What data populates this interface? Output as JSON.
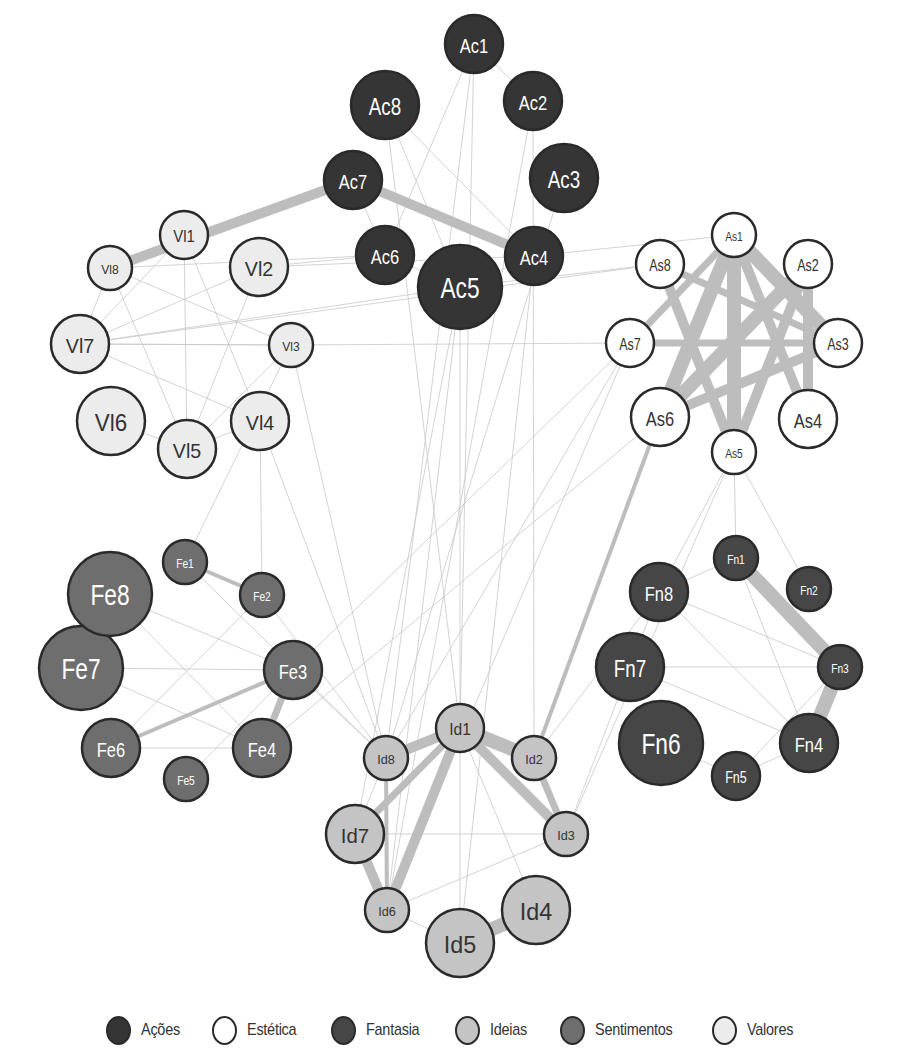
{
  "groups": [
    {
      "id": "Ac",
      "name": "Ações",
      "fill": "#353535",
      "text": "#ffffff"
    },
    {
      "id": "As",
      "name": "Estética",
      "fill": "#ffffff",
      "text": "#333333"
    },
    {
      "id": "Fn",
      "name": "Fantasia",
      "fill": "#464646",
      "text": "#ffffff"
    },
    {
      "id": "Id",
      "name": "Ideias",
      "fill": "#c4c4c4",
      "text": "#333333"
    },
    {
      "id": "Fe",
      "name": "Sentimentos",
      "fill": "#6e6e6e",
      "text": "#ffffff"
    },
    {
      "id": "Vl",
      "name": "Valores",
      "fill": "#ececec",
      "text": "#333333"
    }
  ],
  "colors": {
    "stroke": "#2a2a2a",
    "edge": "#c8c8c8",
    "thick_edge": "#bdbdbd"
  },
  "nodes": [
    {
      "id": "Ac1",
      "label": "Ac1",
      "group": "Ac",
      "size": 2
    },
    {
      "id": "Ac2",
      "label": "Ac2",
      "group": "Ac",
      "size": 2
    },
    {
      "id": "Ac3",
      "label": "Ac3",
      "group": "Ac",
      "size": 3
    },
    {
      "id": "Ac4",
      "label": "Ac4",
      "group": "Ac",
      "size": 2
    },
    {
      "id": "Ac5",
      "label": "Ac5",
      "group": "Ac",
      "size": 4
    },
    {
      "id": "Ac6",
      "label": "Ac6",
      "group": "Ac",
      "size": 2
    },
    {
      "id": "Ac7",
      "label": "Ac7",
      "group": "Ac",
      "size": 2
    },
    {
      "id": "Ac8",
      "label": "Ac8",
      "group": "Ac",
      "size": 3
    },
    {
      "id": "Vl1",
      "label": "Vl1",
      "group": "Vl",
      "size": 1
    },
    {
      "id": "Vl2",
      "label": "Vl2",
      "group": "Vl",
      "size": 2
    },
    {
      "id": "Vl3",
      "label": "Vl3",
      "group": "Vl",
      "size": 0
    },
    {
      "id": "Vl4",
      "label": "Vl4",
      "group": "Vl",
      "size": 2
    },
    {
      "id": "Vl5",
      "label": "Vl5",
      "group": "Vl",
      "size": 2
    },
    {
      "id": "Vl6",
      "label": "Vl6",
      "group": "Vl",
      "size": 3
    },
    {
      "id": "Vl7",
      "label": "Vl7",
      "group": "Vl",
      "size": 2
    },
    {
      "id": "Vl8",
      "label": "Vl8",
      "group": "Vl",
      "size": 0
    },
    {
      "id": "As1",
      "label": "As1",
      "group": "As",
      "size": 0
    },
    {
      "id": "As2",
      "label": "As2",
      "group": "As",
      "size": 1
    },
    {
      "id": "As3",
      "label": "As3",
      "group": "As",
      "size": 1
    },
    {
      "id": "As4",
      "label": "As4",
      "group": "As",
      "size": 2
    },
    {
      "id": "As5",
      "label": "As5",
      "group": "As",
      "size": 0
    },
    {
      "id": "As6",
      "label": "As6",
      "group": "As",
      "size": 2
    },
    {
      "id": "As7",
      "label": "As7",
      "group": "As",
      "size": 1
    },
    {
      "id": "As8",
      "label": "As8",
      "group": "As",
      "size": 1
    },
    {
      "id": "Fe1",
      "label": "Fe1",
      "group": "Fe",
      "size": 0
    },
    {
      "id": "Fe2",
      "label": "Fe2",
      "group": "Fe",
      "size": 0
    },
    {
      "id": "Fe3",
      "label": "Fe3",
      "group": "Fe",
      "size": 2
    },
    {
      "id": "Fe4",
      "label": "Fe4",
      "group": "Fe",
      "size": 2
    },
    {
      "id": "Fe5",
      "label": "Fe5",
      "group": "Fe",
      "size": 0
    },
    {
      "id": "Fe6",
      "label": "Fe6",
      "group": "Fe",
      "size": 2
    },
    {
      "id": "Fe7",
      "label": "Fe7",
      "group": "Fe",
      "size": 4
    },
    {
      "id": "Fe8",
      "label": "Fe8",
      "group": "Fe",
      "size": 4
    },
    {
      "id": "Fn1",
      "label": "Fn1",
      "group": "Fn",
      "size": 0
    },
    {
      "id": "Fn2",
      "label": "Fn2",
      "group": "Fn",
      "size": 0
    },
    {
      "id": "Fn3",
      "label": "Fn3",
      "group": "Fn",
      "size": 0
    },
    {
      "id": "Fn4",
      "label": "Fn4",
      "group": "Fn",
      "size": 2
    },
    {
      "id": "Fn5",
      "label": "Fn5",
      "group": "Fn",
      "size": 1
    },
    {
      "id": "Fn6",
      "label": "Fn6",
      "group": "Fn",
      "size": 4
    },
    {
      "id": "Fn7",
      "label": "Fn7",
      "group": "Fn",
      "size": 3
    },
    {
      "id": "Fn8",
      "label": "Fn8",
      "group": "Fn",
      "size": 2
    },
    {
      "id": "Id1",
      "label": "Id1",
      "group": "Id",
      "size": 1
    },
    {
      "id": "Id2",
      "label": "Id2",
      "group": "Id",
      "size": 0
    },
    {
      "id": "Id3",
      "label": "Id3",
      "group": "Id",
      "size": 0
    },
    {
      "id": "Id4",
      "label": "Id4",
      "group": "Id",
      "size": 3
    },
    {
      "id": "Id5",
      "label": "Id5",
      "group": "Id",
      "size": 3
    },
    {
      "id": "Id6",
      "label": "Id6",
      "group": "Id",
      "size": 0
    },
    {
      "id": "Id7",
      "label": "Id7",
      "group": "Id",
      "size": 2
    },
    {
      "id": "Id8",
      "label": "Id8",
      "group": "Id",
      "size": 0
    }
  ],
  "edges": [
    [
      "Ac7",
      "Vl8",
      3
    ],
    [
      "Ac7",
      "Ac4",
      3
    ],
    [
      "Ac1",
      "Ac2",
      0
    ],
    [
      "Ac8",
      "Ac4",
      0
    ],
    [
      "Ac7",
      "Ac6",
      0
    ],
    [
      "Ac6",
      "Ac5",
      0
    ],
    [
      "Ac5",
      "Ac4",
      0
    ],
    [
      "Ac1",
      "Ac6",
      0
    ],
    [
      "Ac8",
      "Ac5",
      0
    ],
    [
      "Ac6",
      "Vl2",
      0
    ],
    [
      "Ac6",
      "Vl8",
      0
    ],
    [
      "Ac4",
      "As1",
      0
    ],
    [
      "Ac5",
      "As8",
      0
    ],
    [
      "Ac4",
      "Vl2",
      0
    ],
    [
      "Ac5",
      "Vl7",
      0
    ],
    [
      "Ac1",
      "Id8",
      0
    ],
    [
      "Ac1",
      "Id1",
      0
    ],
    [
      "Ac2",
      "Id2",
      0
    ],
    [
      "Ac5",
      "Id7",
      0
    ],
    [
      "Ac5",
      "Id1",
      0
    ],
    [
      "Ac5",
      "Id6",
      0
    ],
    [
      "Ac2",
      "Id6",
      0
    ],
    [
      "Ac8",
      "Id1",
      0
    ],
    [
      "Ac4",
      "Id5",
      0
    ],
    [
      "Ac3",
      "Id8",
      0
    ],
    [
      "Vl1",
      "Vl5",
      0
    ],
    [
      "Vl1",
      "Vl4",
      0
    ],
    [
      "Vl8",
      "Vl3",
      0
    ],
    [
      "Vl8",
      "Vl5",
      0
    ],
    [
      "Vl2",
      "Vl7",
      0
    ],
    [
      "Vl1",
      "Vl7",
      0
    ],
    [
      "Vl7",
      "Vl3",
      0
    ],
    [
      "Vl7",
      "Vl4",
      0
    ],
    [
      "Vl2",
      "Vl5",
      0
    ],
    [
      "Vl6",
      "Vl5",
      0
    ],
    [
      "Vl5",
      "Vl4",
      0
    ],
    [
      "Vl3",
      "Vl5",
      0
    ],
    [
      "Vl3",
      "Vl7",
      0
    ],
    [
      "Vl8",
      "Vl7",
      0
    ],
    [
      "Vl3",
      "Id8",
      0
    ],
    [
      "Vl4",
      "Id8",
      0
    ],
    [
      "Vl3",
      "Fe1",
      0
    ],
    [
      "Vl4",
      "Fe2",
      0
    ],
    [
      "Vl3",
      "As7",
      0
    ],
    [
      "Vl7",
      "As8",
      0
    ],
    [
      "As1",
      "As3",
      4
    ],
    [
      "As1",
      "As5",
      4
    ],
    [
      "As1",
      "As6",
      4
    ],
    [
      "As2",
      "As6",
      4
    ],
    [
      "As1",
      "As4",
      3
    ],
    [
      "As8",
      "As5",
      3
    ],
    [
      "As2",
      "As4",
      3
    ],
    [
      "As7",
      "As3",
      2
    ],
    [
      "As1",
      "As7",
      2
    ],
    [
      "As2",
      "As5",
      3
    ],
    [
      "As6",
      "As3",
      3
    ],
    [
      "As8",
      "As3",
      2
    ],
    [
      "As6",
      "Id2",
      1
    ],
    [
      "As7",
      "Id8",
      0
    ],
    [
      "As7",
      "Fe3",
      0
    ],
    [
      "As5",
      "Id3",
      0
    ],
    [
      "As5",
      "Fn2",
      0
    ],
    [
      "As5",
      "Fn1",
      0
    ],
    [
      "As6",
      "Fe4",
      0
    ],
    [
      "As5",
      "Fn8",
      0
    ],
    [
      "As7",
      "Id6",
      0
    ],
    [
      "Fe1",
      "Fe2",
      1
    ],
    [
      "Fe6",
      "Fe3",
      1
    ],
    [
      "Fe3",
      "Fe4",
      2
    ],
    [
      "Fe8",
      "Fe3",
      0
    ],
    [
      "Fe8",
      "Fe4",
      0
    ],
    [
      "Fe7",
      "Fe3",
      0
    ],
    [
      "Fe7",
      "Fe4",
      0
    ],
    [
      "Fe6",
      "Fe4",
      0
    ],
    [
      "Fe5",
      "Fe3",
      0
    ],
    [
      "Fe1",
      "Id8",
      0
    ],
    [
      "Fe2",
      "Id8",
      0
    ],
    [
      "Fe3",
      "Id8",
      0
    ],
    [
      "Fe6",
      "Fe2",
      0
    ],
    [
      "Fn1",
      "Fn3",
      4
    ],
    [
      "Fn3",
      "Fn4",
      4
    ],
    [
      "Fn8",
      "Fn1",
      0
    ],
    [
      "Fn8",
      "Fn3",
      0
    ],
    [
      "Fn8",
      "Fn4",
      0
    ],
    [
      "Fn7",
      "Fn3",
      0
    ],
    [
      "Fn7",
      "Fn4",
      0
    ],
    [
      "Fn6",
      "Fn5",
      0
    ],
    [
      "Fn5",
      "Fn4",
      0
    ],
    [
      "Fn5",
      "Fn3",
      0
    ],
    [
      "Fn1",
      "Fn4",
      0
    ],
    [
      "Fn8",
      "Fn7",
      0
    ],
    [
      "Fn8",
      "Id2",
      0
    ],
    [
      "Fn7",
      "Id3",
      0
    ],
    [
      "Id1",
      "Id2",
      4
    ],
    [
      "Id1",
      "Id8",
      3
    ],
    [
      "Id1",
      "Id3",
      3
    ],
    [
      "Id1",
      "Id7",
      2
    ],
    [
      "Id1",
      "Id6",
      3
    ],
    [
      "Id7",
      "Id6",
      3
    ],
    [
      "Id2",
      "Id3",
      2
    ],
    [
      "Id4",
      "Id5",
      4
    ],
    [
      "Id8",
      "Id6",
      1
    ],
    [
      "Id1",
      "Id5",
      0
    ],
    [
      "Id1",
      "Id4",
      0
    ],
    [
      "Id7",
      "Id3",
      0
    ],
    [
      "Id6",
      "Id3",
      0
    ],
    [
      "Id6",
      "Id5",
      0
    ],
    [
      "Id8",
      "Id7",
      0
    ]
  ],
  "chart_data": {
    "type": "network",
    "title": "",
    "legend": [
      "Ações",
      "Estética",
      "Fantasia",
      "Ideias",
      "Sentimentos",
      "Valores"
    ],
    "legend_position": "bottom"
  }
}
